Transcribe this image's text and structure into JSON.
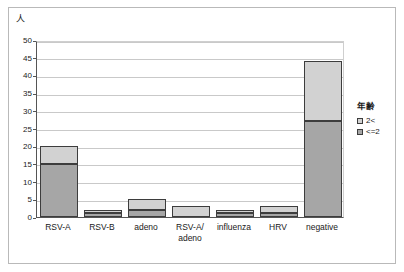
{
  "chart_data": {
    "type": "bar",
    "stacked": true,
    "title": "",
    "subtitle": "",
    "xlabel": "",
    "ylabel": "人",
    "ylim": [
      0,
      50
    ],
    "ytick_step": 5,
    "yticks": [
      "50",
      "45",
      "40",
      "35",
      "30",
      "25",
      "20",
      "15",
      "10",
      "5",
      "0"
    ],
    "grid": true,
    "legend_position": "right",
    "legend_title": "年齢",
    "categories": [
      "RSV-A",
      "RSV-B",
      "adeno",
      "RSV-A/\nadeno",
      "influenza",
      "HRV",
      "negative"
    ],
    "series": [
      {
        "name": "<=2",
        "color": "#a6a6a6",
        "values": [
          15,
          1,
          2,
          0,
          1,
          1,
          27
        ]
      },
      {
        "name": "2<",
        "color": "#d2d2d2",
        "values": [
          5,
          1,
          3,
          3,
          1,
          2,
          17
        ]
      }
    ],
    "totals": [
      20,
      2,
      5,
      3,
      2,
      3,
      44
    ]
  },
  "colors": {
    "series_low": "#a6a6a6",
    "series_high": "#d2d2d2",
    "bar_outline": "#3d3d3d",
    "axis": "#555555",
    "gridline": "#c9c9c9",
    "frame": "#b9b9b9",
    "background": "#ffffff",
    "text": "#1a1a1a"
  }
}
